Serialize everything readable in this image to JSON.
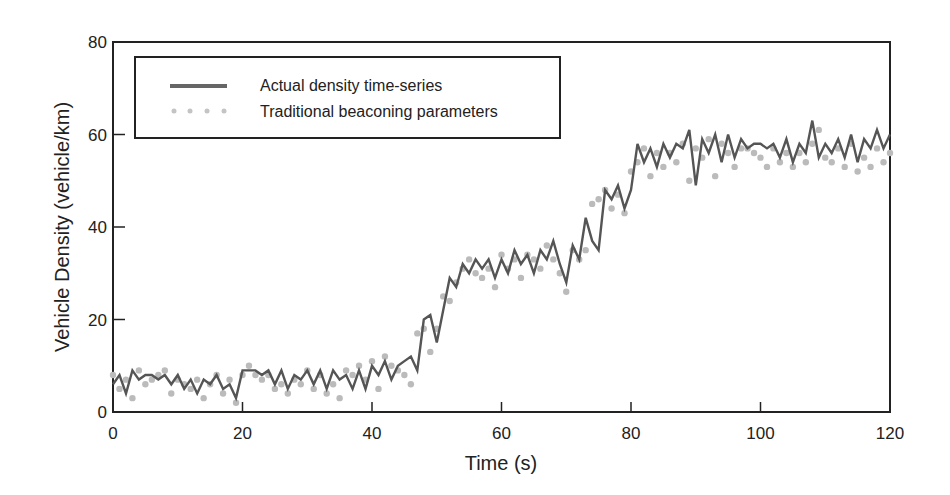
{
  "chart_data": {
    "type": "line",
    "title": "",
    "xlabel": "Time (s)",
    "ylabel": "Vehicle Density (vehicle/km)",
    "xlim": [
      0,
      120
    ],
    "ylim": [
      0,
      80
    ],
    "xticks": [
      0,
      20,
      40,
      60,
      80,
      100,
      120
    ],
    "yticks": [
      0,
      20,
      40,
      60,
      80
    ],
    "grid": false,
    "legend_position": "upper left (inside)",
    "colors": {
      "actual": "#555555",
      "traditional": "#bbbbbb",
      "axis": "#222222"
    },
    "series": [
      {
        "name": "Actual density time-series",
        "style": "solid line",
        "x": [
          0,
          1,
          2,
          3,
          4,
          5,
          6,
          7,
          8,
          9,
          10,
          11,
          12,
          13,
          14,
          15,
          16,
          17,
          18,
          19,
          20,
          21,
          22,
          23,
          24,
          25,
          26,
          27,
          28,
          29,
          30,
          31,
          32,
          33,
          34,
          35,
          36,
          37,
          38,
          39,
          40,
          41,
          42,
          43,
          44,
          45,
          46,
          47,
          48,
          49,
          50,
          51,
          52,
          53,
          54,
          55,
          56,
          57,
          58,
          59,
          60,
          61,
          62,
          63,
          64,
          65,
          66,
          67,
          68,
          69,
          70,
          71,
          72,
          73,
          74,
          75,
          76,
          77,
          78,
          79,
          80,
          81,
          82,
          83,
          84,
          85,
          86,
          87,
          88,
          89,
          90,
          91,
          92,
          93,
          94,
          95,
          96,
          97,
          98,
          99,
          100,
          101,
          102,
          103,
          104,
          105,
          106,
          107,
          108,
          109,
          110,
          111,
          112,
          113,
          114,
          115,
          116,
          117,
          118,
          119,
          120
        ],
        "values": [
          6,
          8,
          4,
          9,
          7,
          8,
          8,
          7,
          8,
          6,
          8,
          5,
          7,
          4,
          7,
          6,
          8,
          5,
          6,
          3,
          9,
          9,
          9,
          8,
          9,
          6,
          9,
          5,
          8,
          7,
          9,
          6,
          9,
          5,
          9,
          7,
          8,
          5,
          9,
          5,
          10,
          8,
          11,
          7,
          10,
          11,
          12,
          9,
          20,
          21,
          15,
          22,
          29,
          27,
          32,
          30,
          33,
          31,
          33,
          29,
          33,
          30,
          35,
          32,
          34,
          30,
          35,
          33,
          37,
          32,
          28,
          36,
          33,
          42,
          37,
          35,
          48,
          46,
          49,
          44,
          48,
          58,
          54,
          57,
          53,
          58,
          55,
          58,
          57,
          61,
          49,
          59,
          56,
          60,
          54,
          60,
          55,
          59,
          57,
          58,
          58,
          57,
          58,
          55,
          59,
          54,
          58,
          56,
          63,
          55,
          58,
          56,
          59,
          55,
          60,
          54,
          59,
          57,
          61,
          57,
          60
        ],
        "note": "values estimated from pixel positions"
      },
      {
        "name": "Traditional beaconing parameters",
        "style": "dotted markers",
        "x": [
          0,
          1,
          2,
          3,
          4,
          5,
          6,
          7,
          8,
          9,
          10,
          11,
          12,
          13,
          14,
          15,
          16,
          17,
          18,
          19,
          20,
          21,
          22,
          23,
          24,
          25,
          26,
          27,
          28,
          29,
          30,
          31,
          32,
          33,
          34,
          35,
          36,
          37,
          38,
          39,
          40,
          41,
          42,
          43,
          44,
          45,
          46,
          47,
          48,
          49,
          50,
          51,
          52,
          53,
          54,
          55,
          56,
          57,
          58,
          59,
          60,
          61,
          62,
          63,
          64,
          65,
          66,
          67,
          68,
          69,
          70,
          71,
          72,
          73,
          74,
          75,
          76,
          77,
          78,
          79,
          80,
          81,
          82,
          83,
          84,
          85,
          86,
          87,
          88,
          89,
          90,
          91,
          92,
          93,
          94,
          95,
          96,
          97,
          98,
          99,
          100,
          101,
          102,
          103,
          104,
          105,
          106,
          107,
          108,
          109,
          110,
          111,
          112,
          113,
          114,
          115,
          116,
          117,
          118,
          119,
          120
        ],
        "values": [
          8,
          5,
          7,
          3,
          9,
          6,
          7,
          8,
          9,
          4,
          7,
          6,
          5,
          7,
          3,
          6,
          8,
          4,
          7,
          2,
          8,
          10,
          8,
          7,
          8,
          5,
          6,
          4,
          7,
          6,
          9,
          5,
          8,
          4,
          6,
          3,
          9,
          8,
          10,
          7,
          11,
          5,
          12,
          10,
          9,
          8,
          6,
          17,
          18,
          13,
          18,
          25,
          24,
          28,
          31,
          33,
          30,
          29,
          31,
          27,
          34,
          31,
          33,
          29,
          34,
          33,
          31,
          36,
          33,
          30,
          26,
          35,
          33,
          35,
          45,
          46,
          48,
          44,
          47,
          43,
          52,
          54,
          57,
          51,
          56,
          53,
          56,
          54,
          58,
          50,
          57,
          55,
          59,
          51,
          58,
          56,
          53,
          57,
          57,
          56,
          55,
          53,
          57,
          54,
          56,
          53,
          56,
          54,
          58,
          61,
          55,
          54,
          57,
          53,
          58,
          52,
          55,
          53,
          57,
          54,
          56
        ],
        "note": "values estimated from pixel positions"
      }
    ]
  },
  "axes": {
    "x_title": "Time (s)",
    "y_title": "Vehicle Density (vehicle/km)",
    "x_tick_labels": [
      "0",
      "20",
      "40",
      "60",
      "80",
      "100",
      "120"
    ],
    "y_tick_labels": [
      "0",
      "20",
      "40",
      "60",
      "80"
    ]
  },
  "legend": {
    "items": [
      {
        "label": "Actual density time-series",
        "marker": "line"
      },
      {
        "label": "Traditional beaconing parameters",
        "marker": "dots"
      }
    ]
  }
}
